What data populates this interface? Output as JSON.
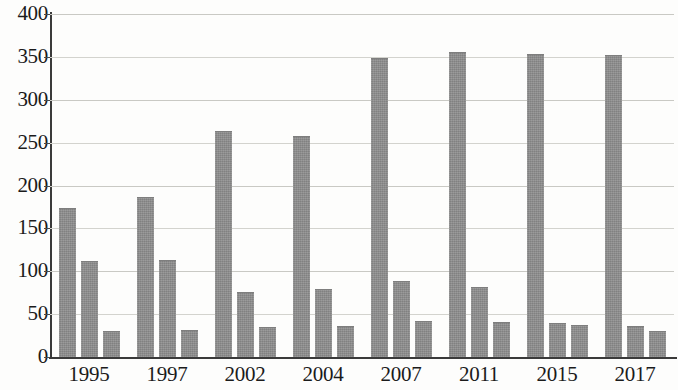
{
  "chart_data": {
    "type": "bar",
    "title": "",
    "subtitle": "",
    "xlabel": "",
    "ylabel": "",
    "ylim": [
      0,
      400
    ],
    "ytick_step": 50,
    "yticks": [
      0,
      50,
      100,
      150,
      200,
      250,
      300,
      350,
      400
    ],
    "ytick_labels": [
      "0",
      "50",
      "100",
      "150",
      "200",
      "250",
      "300",
      "350",
      "400"
    ],
    "grid": true,
    "grid_axis": "y",
    "legend": false,
    "legend_position": "none",
    "bar_color": "#8d8d8d",
    "axis_color": "#3a3a3a",
    "gridline_color": "#c9c9c4",
    "categories": [
      "1995",
      "1997",
      "2002",
      "2004",
      "2007",
      "2011",
      "2015",
      "2017"
    ],
    "series": [
      {
        "name": "Series 1",
        "values": [
          173,
          186,
          262,
          256,
          348,
          355,
          352,
          351
        ]
      },
      {
        "name": "Series 2",
        "values": [
          111,
          112,
          75,
          78,
          88,
          81,
          39,
          35
        ]
      },
      {
        "name": "Series 3",
        "values": [
          29,
          30,
          34,
          35,
          41,
          40,
          36,
          29
        ]
      }
    ],
    "bars": [
      {
        "category": "1995",
        "series": "Series 1",
        "value": 173
      },
      {
        "category": "1995",
        "series": "Series 2",
        "value": 111
      },
      {
        "category": "1995",
        "series": "Series 3",
        "value": 29
      },
      {
        "category": "1997",
        "series": "Series 1",
        "value": 186
      },
      {
        "category": "1997",
        "series": "Series 2",
        "value": 112
      },
      {
        "category": "1997",
        "series": "Series 3",
        "value": 30
      },
      {
        "category": "2002",
        "series": "Series 1",
        "value": 262
      },
      {
        "category": "2002",
        "series": "Series 2",
        "value": 75
      },
      {
        "category": "2002",
        "series": "Series 3",
        "value": 34
      },
      {
        "category": "2004",
        "series": "Series 1",
        "value": 256
      },
      {
        "category": "2004",
        "series": "Series 2",
        "value": 78
      },
      {
        "category": "2004",
        "series": "Series 3",
        "value": 35
      },
      {
        "category": "2007",
        "series": "Series 1",
        "value": 348
      },
      {
        "category": "2007",
        "series": "Series 2",
        "value": 88
      },
      {
        "category": "2007",
        "series": "Series 3",
        "value": 41
      },
      {
        "category": "2011",
        "series": "Series 1",
        "value": 355
      },
      {
        "category": "2011",
        "series": "Series 2",
        "value": 81
      },
      {
        "category": "2011",
        "series": "Series 3",
        "value": 40
      },
      {
        "category": "2015",
        "series": "Series 1",
        "value": 352
      },
      {
        "category": "2015",
        "series": "Series 2",
        "value": 39
      },
      {
        "category": "2015",
        "series": "Series 3",
        "value": 36
      },
      {
        "category": "2017",
        "series": "Series 1",
        "value": 351
      },
      {
        "category": "2017",
        "series": "Series 2",
        "value": 35
      },
      {
        "category": "2017",
        "series": "Series 3",
        "value": 29
      }
    ]
  }
}
